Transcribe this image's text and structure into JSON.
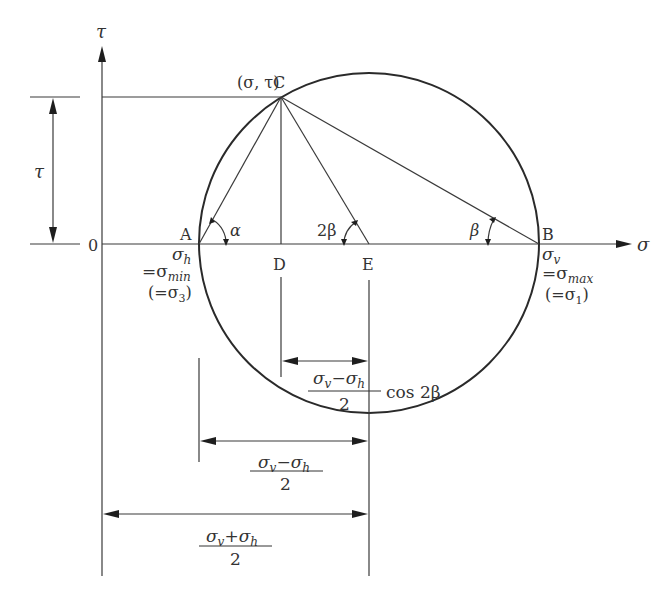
{
  "diagram": {
    "axes": {
      "x_label": "σ",
      "y_label": "τ",
      "origin_label": "0"
    },
    "points": {
      "A": {
        "label": "A",
        "stress_label": "σ",
        "stress_sub": "h",
        "equals_label": "=σ",
        "equals_sub": "min",
        "principal_open": "(=σ",
        "principal_sub": "3",
        "principal_close": ")"
      },
      "B": {
        "label": "B",
        "stress_label": "σ",
        "stress_sub": "v",
        "equals_label": "=σ",
        "equals_sub": "max",
        "principal_open": "(=σ",
        "principal_sub": "1",
        "principal_close": ")"
      },
      "C": {
        "label": "C",
        "coord_label": "(σ, τ)"
      },
      "D": {
        "label": "D"
      },
      "E": {
        "label": "E"
      }
    },
    "angles": {
      "alpha": "α",
      "two_beta": "2β",
      "beta": "β"
    },
    "dimensions": {
      "tau": "τ",
      "d_cos": {
        "num_a": "σ",
        "num_a_sub": "v",
        "minus": "−",
        "num_b": "σ",
        "num_b_sub": "h",
        "den": "2",
        "suffix": "cos 2β"
      },
      "radius": {
        "num_a": "σ",
        "num_a_sub": "v",
        "minus": "−",
        "num_b": "σ",
        "num_b_sub": "h",
        "den": "2"
      },
      "center": {
        "num_a": "σ",
        "num_a_sub": "v",
        "plus": "+",
        "num_b": "σ",
        "num_b_sub": "h",
        "den": "2"
      }
    }
  }
}
